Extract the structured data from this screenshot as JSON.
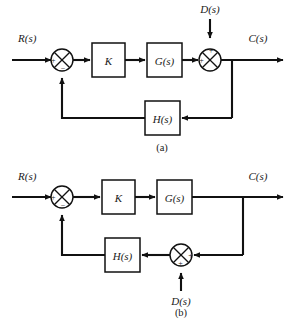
{
  "figure": {
    "type": "control-system-block-diagram",
    "background_color": "#ffffff",
    "line_color": "#111111",
    "text_color": "#1a1a1a",
    "diagrams": [
      {
        "caption": "(a)",
        "input_label": "R(s)",
        "output_label": "C(s)",
        "disturbance_label": "D(s)",
        "disturbance_position": "top",
        "blocks": [
          {
            "label": "K"
          },
          {
            "label": "G(s)"
          },
          {
            "label": "H(s)"
          }
        ],
        "summing_junctions": [
          {
            "name": "error-junction",
            "signs": [
              "+",
              "-"
            ],
            "sign_left": "+",
            "sign_bottom": "−"
          },
          {
            "name": "disturbance-junction",
            "signs": [
              "+",
              "+"
            ],
            "sign_left": "+",
            "sign_top": "+"
          }
        ],
        "description": "Disturbance enters after G(s); feedback through H(s) to error junction."
      },
      {
        "caption": "(b)",
        "input_label": "R(s)",
        "output_label": "C(s)",
        "disturbance_label": "D(s)",
        "disturbance_position": "bottom",
        "blocks": [
          {
            "label": "K"
          },
          {
            "label": "G(s)"
          },
          {
            "label": "H(s)"
          }
        ],
        "summing_junctions": [
          {
            "name": "error-junction",
            "signs": [
              "+",
              "-"
            ],
            "sign_left": "+",
            "sign_bottom": "−"
          },
          {
            "name": "disturbance-junction",
            "signs": [
              "+",
              "+"
            ],
            "sign_right": "+",
            "sign_bottom": "+"
          }
        ],
        "description": "Disturbance enters the feedback path before H(s); feedback to error junction."
      }
    ]
  },
  "labels": {
    "a": {
      "input": "R(s)",
      "output": "C(s)",
      "disturbance": "D(s)",
      "gain": "K",
      "plant": "G(s)",
      "feedback": "H(s)",
      "caption": "(a)",
      "sum1_plus": "+",
      "sum1_minus": "−",
      "sum2_plus_top": "+",
      "sum2_plus_left": "+"
    },
    "b": {
      "input": "R(s)",
      "output": "C(s)",
      "disturbance": "D(s)",
      "gain": "K",
      "plant": "G(s)",
      "feedback": "H(s)",
      "caption": "(b)",
      "sum1_plus": "+",
      "sum1_minus": "−",
      "sum2_plus_right": "+",
      "sum2_plus_bottom": "+"
    }
  }
}
